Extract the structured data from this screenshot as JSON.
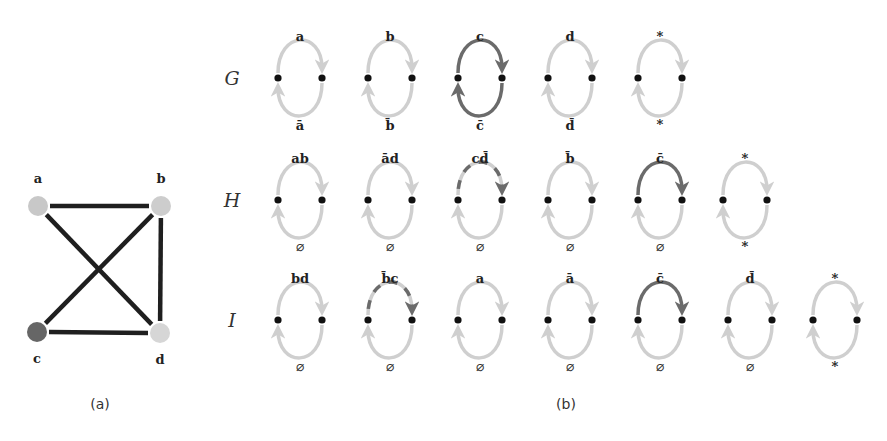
{
  "colors": {
    "light": "#cfcfcf",
    "dark": "#6b6b6b",
    "node_dot": "#111111",
    "edge": "#1f1f1f",
    "vertex_a": "#c8c8c8",
    "vertex_b": "#cdcdcd",
    "vertex_c": "#666666",
    "vertex_d": "#d6d6d6"
  },
  "panel_a": {
    "caption": "(a)",
    "vertices": [
      {
        "id": "a",
        "label": "a",
        "x": 38,
        "y": 206,
        "color": "#c8c8c8"
      },
      {
        "id": "b",
        "label": "b",
        "x": 161,
        "y": 206,
        "color": "#cdcdcd"
      },
      {
        "id": "c",
        "label": "c",
        "x": 37,
        "y": 332,
        "color": "#666666"
      },
      {
        "id": "d",
        "label": "d",
        "x": 160,
        "y": 333,
        "color": "#d6d6d6"
      }
    ],
    "edges": [
      [
        "a",
        "b"
      ],
      [
        "a",
        "d"
      ],
      [
        "b",
        "c"
      ],
      [
        "b",
        "d"
      ],
      [
        "c",
        "d"
      ]
    ]
  },
  "panel_b": {
    "caption": "(b)",
    "rows": [
      {
        "name": "G",
        "y": 78,
        "cycles": [
          {
            "top": "a",
            "bottom": "ā",
            "top_style": "light",
            "bottom_style": "light"
          },
          {
            "top": "b",
            "bottom": "b̄",
            "top_style": "light",
            "bottom_style": "light"
          },
          {
            "top": "c",
            "bottom": "c̄",
            "top_style": "dark",
            "bottom_style": "dark"
          },
          {
            "top": "d",
            "bottom": "d̄",
            "top_style": "light",
            "bottom_style": "light"
          },
          {
            "top": "*",
            "bottom": "*",
            "top_style": "light",
            "bottom_style": "light"
          }
        ]
      },
      {
        "name": "H",
        "y": 200,
        "cycles": [
          {
            "top": "ab",
            "bottom": "∅",
            "top_style": "light",
            "bottom_style": "light"
          },
          {
            "top": "ād",
            "bottom": "∅",
            "top_style": "light",
            "bottom_style": "light"
          },
          {
            "top": "cd̄",
            "bottom": "∅",
            "top_style": "mixed",
            "bottom_style": "light"
          },
          {
            "top": "b̄",
            "bottom": "∅",
            "top_style": "light",
            "bottom_style": "light"
          },
          {
            "top": "c̄",
            "bottom": "∅",
            "top_style": "dark",
            "bottom_style": "light"
          },
          {
            "top": "*",
            "bottom": "*",
            "top_style": "light",
            "bottom_style": "light"
          }
        ]
      },
      {
        "name": "I",
        "y": 320,
        "cycles": [
          {
            "top": "bd",
            "bottom": "∅",
            "top_style": "light",
            "bottom_style": "light"
          },
          {
            "top": "b̄c",
            "bottom": "∅",
            "top_style": "mixed",
            "bottom_style": "light"
          },
          {
            "top": "a",
            "bottom": "∅",
            "top_style": "light",
            "bottom_style": "light"
          },
          {
            "top": "ā",
            "bottom": "∅",
            "top_style": "light",
            "bottom_style": "light"
          },
          {
            "top": "c̄",
            "bottom": "∅",
            "top_style": "dark",
            "bottom_style": "light"
          },
          {
            "top": "d̄",
            "bottom": "∅",
            "top_style": "light",
            "bottom_style": "light"
          },
          {
            "top": "*",
            "bottom": "*",
            "top_style": "light",
            "bottom_style": "light"
          }
        ]
      }
    ],
    "cycle_x": {
      "G": [
        300,
        390,
        480,
        570,
        660
      ],
      "H": [
        300,
        390,
        480,
        570,
        660,
        745
      ],
      "I": [
        300,
        390,
        480,
        570,
        660,
        750,
        835
      ]
    }
  }
}
